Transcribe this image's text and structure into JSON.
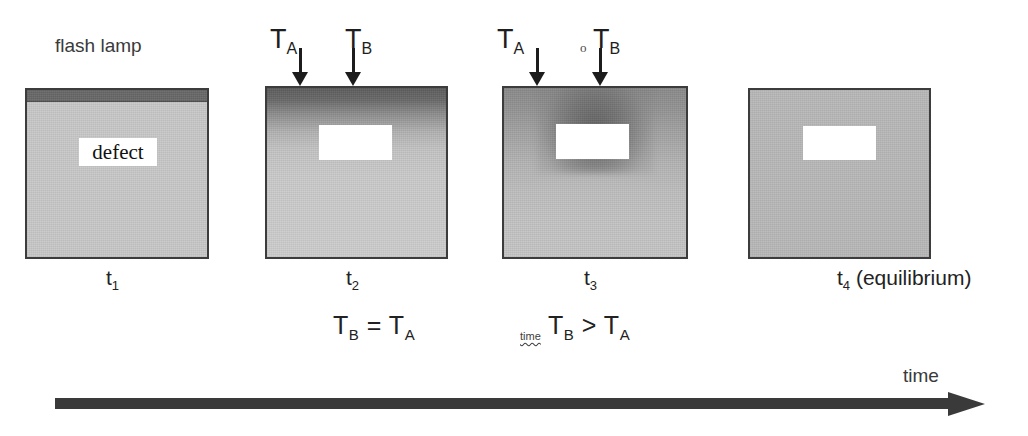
{
  "diagram": {
    "flash_lamp_label": "flash lamp",
    "defect_label": "defect",
    "time_axis_label": "time"
  },
  "panels": [
    {
      "id": "t1",
      "time_label": "t",
      "time_sub": "1",
      "time_suffix": "",
      "caption": "",
      "caption_sub_b": "",
      "caption_sub_a": "",
      "has_lamp": true,
      "has_probes": false,
      "defect_is_text": true
    },
    {
      "id": "t2",
      "time_label": "t",
      "time_sub": "2",
      "time_suffix": "",
      "caption_lead": "",
      "caption_T1": "T",
      "caption_sub_b": "B",
      "caption_op": "=",
      "caption_T2": "T",
      "caption_sub_a": "A",
      "has_lamp": false,
      "has_probes": true,
      "defect_is_text": false
    },
    {
      "id": "t3",
      "time_label": "t",
      "time_sub": "3",
      "time_suffix": "",
      "caption_lead": "time",
      "caption_T1": "T",
      "caption_sub_b": "B",
      "caption_op": ">",
      "caption_T2": "T",
      "caption_sub_a": "A",
      "has_lamp": false,
      "has_probes": true,
      "defect_is_text": false
    },
    {
      "id": "t4",
      "time_label": "t",
      "time_sub": "4",
      "time_suffix": " (equilibrium)",
      "caption": "",
      "has_lamp": false,
      "has_probes": false,
      "defect_is_text": false
    }
  ],
  "probes": {
    "a_label": "T",
    "a_sub": "A",
    "b_label": "T",
    "b_sub": "B"
  },
  "artifacts": {
    "panel3_probe_o": "o"
  },
  "colors": {
    "lamp": "#696969",
    "body_cold": "#c9c9c9",
    "body_equilibrium": "#b9b9b9",
    "defect": "#ffffff",
    "ink": "#2b2b2b",
    "axis": "#3a3a3a",
    "border": "#3c3c3c"
  }
}
